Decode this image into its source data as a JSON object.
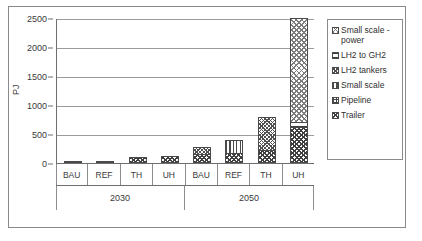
{
  "chart_data": {
    "type": "bar",
    "title": "",
    "subtitle": "",
    "xlabel": "",
    "ylabel": "PJ",
    "ylim": [
      0,
      2500
    ],
    "yticks": [
      0,
      500,
      1000,
      1500,
      2000,
      2500
    ],
    "ytick_labels": [
      "0",
      "500",
      "1000",
      "1500",
      "2000",
      "2500"
    ],
    "grid": true,
    "stacked": true,
    "legend_position": "right",
    "categories": [
      "BAU",
      "REF",
      "TH",
      "UH",
      "BAU",
      "REF",
      "TH",
      "UH"
    ],
    "groups": [
      {
        "label": "2030",
        "categories": [
          "BAU",
          "REF",
          "TH",
          "UH"
        ]
      },
      {
        "label": "2050",
        "categories": [
          "BAU",
          "REF",
          "TH",
          "UH"
        ]
      }
    ],
    "series": [
      {
        "name": "Trailer",
        "pattern": "checker-fine",
        "values": [
          10,
          5,
          100,
          120,
          150,
          180,
          230,
          620
        ]
      },
      {
        "name": "Pipeline",
        "pattern": "grid-square",
        "values": [
          0,
          0,
          0,
          0,
          0,
          0,
          0,
          0
        ]
      },
      {
        "name": "Small scale",
        "pattern": "vertical-lines",
        "values": [
          0,
          0,
          0,
          0,
          0,
          220,
          0,
          0
        ]
      },
      {
        "name": "LH2 tankers",
        "pattern": "crosshatch",
        "values": [
          0,
          0,
          0,
          0,
          130,
          0,
          570,
          0
        ]
      },
      {
        "name": "LH2 to GH2",
        "pattern": "horizontal-lines",
        "values": [
          0,
          0,
          0,
          0,
          0,
          0,
          0,
          90
        ]
      },
      {
        "name": "Small scale - power",
        "pattern": "checker-light",
        "values": [
          0,
          0,
          0,
          0,
          0,
          0,
          0,
          1790
        ]
      }
    ],
    "totals": [
      10,
      5,
      100,
      120,
      280,
      400,
      800,
      2500
    ]
  },
  "legend": {
    "items": [
      {
        "label": "Small scale -\npower"
      },
      {
        "label": "LH2 to GH2"
      },
      {
        "label": "LH2 tankers"
      },
      {
        "label": "Small scale"
      },
      {
        "label": "Pipeline"
      },
      {
        "label": "Trailer"
      }
    ]
  }
}
